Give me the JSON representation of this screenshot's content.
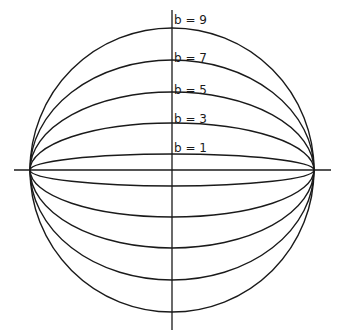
{
  "diagram": {
    "type": "family-of-ellipses",
    "center": {
      "x": 172,
      "y": 170
    },
    "semi_major_axis_px": 142,
    "axes": {
      "horizontal": {
        "x1": 14,
        "x2": 331,
        "y": 170
      },
      "vertical": {
        "x": 172,
        "y1": 10,
        "y2": 330
      }
    },
    "curves": [
      {
        "b": 9,
        "label": "b = 9",
        "ry": 142,
        "label_y": 24
      },
      {
        "b": 7,
        "label": "b = 7",
        "ry": 110,
        "label_y": 62
      },
      {
        "b": 5,
        "label": "b = 5",
        "ry": 78,
        "label_y": 94
      },
      {
        "b": 3,
        "label": "b = 3",
        "ry": 47,
        "label_y": 123
      },
      {
        "b": 1,
        "label": "b = 1",
        "ry": 16,
        "label_y": 152
      }
    ],
    "stroke_color": "#1a1a1a",
    "background": "#ffffff"
  }
}
